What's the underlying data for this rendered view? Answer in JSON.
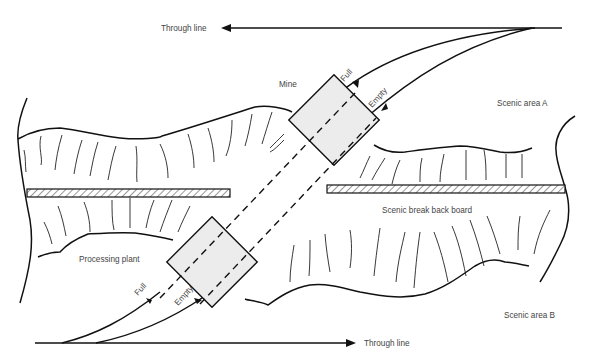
{
  "labels": {
    "through_line_top": "Through line",
    "through_line_bottom": "Through line",
    "mine": "Mine",
    "scenic_area_a": "Scenic area A",
    "scenic_area_b": "Scenic area B",
    "processing_plant": "Processing plant",
    "scenic_break_back_board": "Scenic break back board",
    "full_top": "Full",
    "empty_top": "Empty",
    "full_bottom": "Full",
    "empty_bottom": "Empty"
  },
  "colors": {
    "line": "#111111",
    "box_fill": "#ececec",
    "text": "#444444"
  }
}
